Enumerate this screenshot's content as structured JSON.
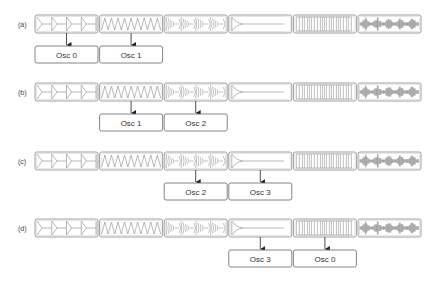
{
  "figure": {
    "waveforms": [
      {
        "id": "w0",
        "name": "decaying-pulse-train"
      },
      {
        "id": "w1",
        "name": "triangle-wave"
      },
      {
        "id": "w2",
        "name": "modulated-bursts"
      },
      {
        "id": "w3",
        "name": "chirp-decay"
      },
      {
        "id": "w4",
        "name": "square-pulse-train"
      },
      {
        "id": "w5",
        "name": "noise-bursts"
      }
    ],
    "rows": [
      {
        "label": "(a)",
        "oscillators": [
          {
            "label": "Osc 0",
            "source": 0
          },
          {
            "label": "Osc 1",
            "source": 1
          }
        ]
      },
      {
        "label": "(b)",
        "oscillators": [
          {
            "label": "Osc 1",
            "source": 1
          },
          {
            "label": "Osc 2",
            "source": 2
          }
        ]
      },
      {
        "label": "(c)",
        "oscillators": [
          {
            "label": "Osc 2",
            "source": 2
          },
          {
            "label": "Osc 3",
            "source": 3
          }
        ]
      },
      {
        "label": "(d)",
        "oscillators": [
          {
            "label": "Osc 3",
            "source": 3
          },
          {
            "label": "Osc 0",
            "source": 4
          }
        ]
      }
    ],
    "colors": {
      "stroke": "#888888",
      "wave": "#999999",
      "noise": "#777777",
      "arrow": "#222222",
      "osc_border": "#666666"
    }
  }
}
